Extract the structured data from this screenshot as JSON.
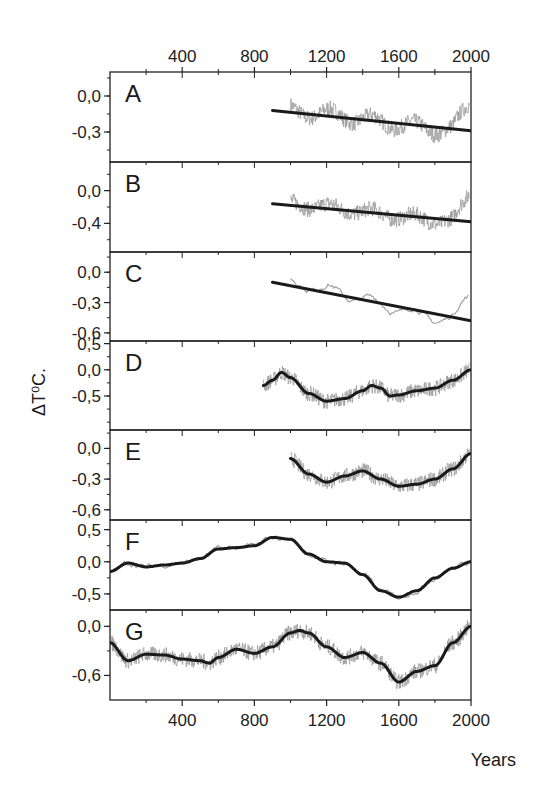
{
  "chart_data": {
    "type": "line",
    "title": "",
    "xlabel": "Years",
    "ylabel": "ΔT⁰C.",
    "xlim": [
      0,
      2000
    ],
    "x_ticks": [
      400,
      800,
      1200,
      1600,
      2000
    ],
    "x_ticks_top": [
      400,
      800,
      1200,
      1600,
      2000
    ],
    "grid": false,
    "legend": null,
    "panels": [
      {
        "label": "A",
        "ylim": [
          -0.55,
          0.2
        ],
        "y_ticks": [
          0.0,
          -0.3
        ],
        "y_tick_labels": [
          "0,0",
          "-0,3"
        ],
        "trend_type": "linear",
        "trend": {
          "x": [
            900,
            2000
          ],
          "y": [
            -0.12,
            -0.29
          ]
        },
        "raw_range": [
          1000,
          1990
        ]
      },
      {
        "label": "B",
        "ylim": [
          -0.75,
          0.35
        ],
        "y_ticks": [
          0.0,
          -0.4
        ],
        "y_tick_labels": [
          "0,0",
          "-0,4"
        ],
        "trend_type": "linear",
        "trend": {
          "x": [
            900,
            2000
          ],
          "y": [
            -0.16,
            -0.38
          ]
        },
        "raw_range": [
          1000,
          1990
        ]
      },
      {
        "label": "C",
        "ylim": [
          -0.68,
          0.2
        ],
        "y_ticks": [
          0.0,
          -0.3,
          -0.6
        ],
        "y_tick_labels": [
          "0,0",
          "-0,3",
          "-0,6"
        ],
        "trend_type": "linear",
        "trend": {
          "x": [
            900,
            2000
          ],
          "y": [
            -0.1,
            -0.48
          ]
        },
        "raw_range": [
          1000,
          1990
        ]
      },
      {
        "label": "D",
        "ylim": [
          -1.15,
          0.55
        ],
        "y_ticks": [
          0.5,
          0.0,
          -0.5
        ],
        "y_tick_labels": [
          "0,5",
          "0,0",
          "-0,5"
        ],
        "trend_type": "smooth",
        "trend": {
          "x": [
            850,
            900,
            950,
            1000,
            1100,
            1200,
            1300,
            1400,
            1450,
            1500,
            1550,
            1600,
            1700,
            1800,
            1900,
            2000
          ],
          "y": [
            -0.3,
            -0.2,
            -0.05,
            -0.15,
            -0.45,
            -0.6,
            -0.55,
            -0.4,
            -0.3,
            -0.35,
            -0.5,
            -0.48,
            -0.4,
            -0.35,
            -0.2,
            0.0
          ]
        },
        "raw_range": [
          850,
          1990
        ]
      },
      {
        "label": "E",
        "ylim": [
          -0.7,
          0.18
        ],
        "y_ticks": [
          0.0,
          -0.3,
          -0.6
        ],
        "y_tick_labels": [
          "0,0",
          "-0,3",
          "-0,6"
        ],
        "trend_type": "smooth",
        "trend": {
          "x": [
            1000,
            1100,
            1200,
            1300,
            1400,
            1500,
            1600,
            1700,
            1800,
            1900,
            2000
          ],
          "y": [
            -0.1,
            -0.25,
            -0.33,
            -0.27,
            -0.22,
            -0.3,
            -0.37,
            -0.35,
            -0.3,
            -0.2,
            -0.05
          ]
        },
        "raw_range": [
          1000,
          1990
        ]
      },
      {
        "label": "F",
        "ylim": [
          -0.75,
          0.65
        ],
        "y_ticks": [
          0.5,
          0.0,
          -0.5
        ],
        "y_tick_labels": [
          "0,5",
          "0,0",
          "-0,5"
        ],
        "trend_type": "smooth",
        "trend": {
          "x": [
            0,
            100,
            200,
            300,
            400,
            500,
            600,
            700,
            800,
            900,
            1000,
            1100,
            1200,
            1300,
            1400,
            1500,
            1600,
            1700,
            1800,
            1900,
            2000
          ],
          "y": [
            -0.15,
            -0.02,
            -0.08,
            -0.05,
            -0.02,
            0.05,
            0.2,
            0.22,
            0.25,
            0.38,
            0.35,
            0.12,
            0.0,
            -0.02,
            -0.2,
            -0.45,
            -0.55,
            -0.45,
            -0.25,
            -0.1,
            0.0
          ]
        },
        "raw_range": [
          0,
          1990
        ]
      },
      {
        "label": "G",
        "ylim": [
          -0.9,
          0.2
        ],
        "y_ticks": [
          0.0,
          -0.6
        ],
        "y_tick_labels": [
          "0,0",
          "-0,6"
        ],
        "trend_type": "smooth",
        "trend": {
          "x": [
            0,
            100,
            200,
            300,
            400,
            500,
            550,
            600,
            700,
            800,
            900,
            1000,
            1050,
            1100,
            1200,
            1300,
            1400,
            1500,
            1600,
            1700,
            1800,
            1900,
            2000
          ],
          "y": [
            -0.2,
            -0.42,
            -0.34,
            -0.35,
            -0.4,
            -0.42,
            -0.45,
            -0.38,
            -0.28,
            -0.33,
            -0.25,
            -0.08,
            -0.05,
            -0.08,
            -0.25,
            -0.38,
            -0.32,
            -0.45,
            -0.68,
            -0.55,
            -0.48,
            -0.2,
            0.0
          ]
        },
        "raw_range": [
          0,
          1990
        ]
      }
    ]
  },
  "layout": {
    "plot_left": 110,
    "plot_right": 471,
    "plot_top": 72,
    "panel_bounds": [
      72,
      162,
      252,
      341,
      430,
      520,
      610,
      700
    ]
  },
  "colors": {
    "axis": "#222222",
    "trend": "#1a1a1a",
    "raw": "#9a9a9a"
  }
}
